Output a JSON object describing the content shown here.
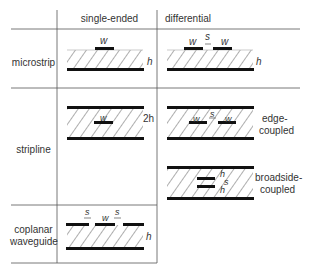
{
  "header": {
    "col1": "single-ended",
    "col2": "differential"
  },
  "rows": {
    "microstrip": "microstrip",
    "stripline": "stripline",
    "coplanar_line1": "coplanar",
    "coplanar_line2": "waveguide"
  },
  "symbols": {
    "w": "w",
    "s": "s",
    "h": "h",
    "two_h": "2h"
  },
  "captions": {
    "edge_line1": "edge-",
    "edge_line2": "coupled",
    "broadside_line1": "broadside-",
    "broadside_line2": "coupled"
  }
}
